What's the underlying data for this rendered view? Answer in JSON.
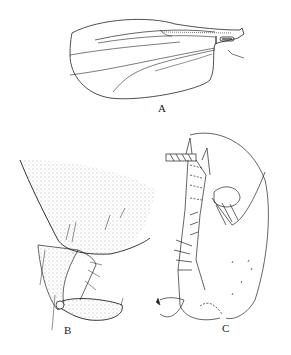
{
  "figure": {
    "panels": [
      {
        "id": "A",
        "label": "A",
        "subject": "wing"
      },
      {
        "id": "B",
        "label": "B",
        "subject": "hypopygium lateral view (stippled)"
      },
      {
        "id": "C",
        "label": "C",
        "subject": "hypopygium line drawing"
      }
    ],
    "colors": {
      "ink": "#222222",
      "background": "#ffffff",
      "stipple": "#555555"
    }
  }
}
